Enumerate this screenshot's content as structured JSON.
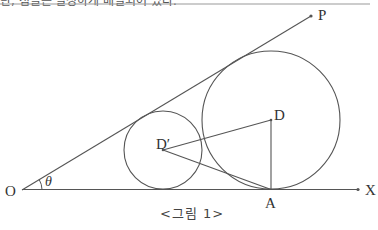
{
  "header": {
    "cut_text": "단, 점들은 일정하게 배열되어 있다.",
    "rule_color": "#999999"
  },
  "figure": {
    "caption": "<그림 1>",
    "stroke_color": "#555555",
    "points": {
      "O": {
        "label": "O",
        "x": 22,
        "y": 190
      },
      "P": {
        "label": "P",
        "x": 311,
        "y": 16
      },
      "X": {
        "label": "X",
        "x": 358,
        "y": 189
      },
      "A": {
        "label": "A",
        "x": 271,
        "y": 189
      },
      "D": {
        "label": "D",
        "x": 271,
        "y": 120
      },
      "D_prime": {
        "label": "D′",
        "x": 163,
        "y": 150
      }
    },
    "angle_label": "θ",
    "circles": [
      {
        "name": "large-circle",
        "center": "D",
        "r": 69
      },
      {
        "name": "small-circle",
        "center": "D′",
        "r": 39
      }
    ],
    "segments": [
      "O-P ray",
      "O-X ray",
      "D-A",
      "D′-D",
      "D′-A"
    ]
  }
}
